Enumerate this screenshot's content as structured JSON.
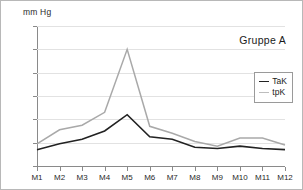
{
  "chart_data": {
    "type": "line",
    "title": "Gruppe A",
    "xlabel": "",
    "ylabel": "mm Hg",
    "ylim": [
      0,
      120
    ],
    "yticks": [
      0,
      20,
      40,
      60,
      80,
      100,
      120
    ],
    "grid": true,
    "legend_position": "right",
    "categories": [
      "M1",
      "M2",
      "M3",
      "M4",
      "M5",
      "M6",
      "M7",
      "M8",
      "M9",
      "M10",
      "M11",
      "M12"
    ],
    "series": [
      {
        "name": "TaK",
        "color": "#222222",
        "values": [
          14,
          19,
          23,
          30,
          44,
          25,
          23,
          16,
          15,
          17,
          15,
          14
        ]
      },
      {
        "name": "tpK",
        "color": "#a9a9a9",
        "values": [
          19,
          31,
          35,
          46,
          100,
          34,
          28,
          21,
          17,
          24,
          24,
          18
        ]
      }
    ]
  },
  "chart": {
    "unit_label": "mm Hg",
    "group_title": "Gruppe A"
  }
}
